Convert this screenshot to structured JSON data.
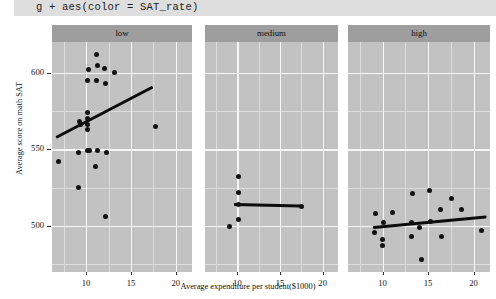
{
  "code_banner": {
    "text": "g + aes(color = SAT_rate)"
  },
  "chart_data": {
    "type": "scatter",
    "title": "g + aes(color = SAT_rate)",
    "xlabel": "Average expenditure per student($1000)",
    "ylabel": "Average score on math SAT",
    "grid": true,
    "legend_position": "none",
    "facet_variable": "SAT_rate",
    "xlim": [
      6.2,
      21.8
    ],
    "ylim": [
      470,
      620
    ],
    "xticks": [
      10,
      15,
      20
    ],
    "yticks": [
      500,
      550,
      600
    ],
    "panel_background": "#c2c2c2",
    "strip_background": "#9e9e9e",
    "point_color": "#121212",
    "line_color": "#0c0c0c",
    "facets": [
      {
        "label": "low",
        "points": [
          {
            "x": 11.2,
            "y": 612
          },
          {
            "x": 11.3,
            "y": 605
          },
          {
            "x": 10.3,
            "y": 602
          },
          {
            "x": 12.1,
            "y": 603
          },
          {
            "x": 13.2,
            "y": 600
          },
          {
            "x": 10.2,
            "y": 595
          },
          {
            "x": 11.2,
            "y": 595
          },
          {
            "x": 12.2,
            "y": 593
          },
          {
            "x": 10.2,
            "y": 574
          },
          {
            "x": 10.2,
            "y": 570
          },
          {
            "x": 9.3,
            "y": 568
          },
          {
            "x": 9.4,
            "y": 566
          },
          {
            "x": 10.2,
            "y": 566
          },
          {
            "x": 10.2,
            "y": 563
          },
          {
            "x": 17.7,
            "y": 565
          },
          {
            "x": 9.1,
            "y": 548
          },
          {
            "x": 10.2,
            "y": 549
          },
          {
            "x": 10.4,
            "y": 549
          },
          {
            "x": 11.3,
            "y": 549
          },
          {
            "x": 12.3,
            "y": 548
          },
          {
            "x": 6.9,
            "y": 542
          },
          {
            "x": 11.1,
            "y": 539
          },
          {
            "x": 9.1,
            "y": 525
          },
          {
            "x": 12.2,
            "y": 506
          }
        ],
        "fit_line": {
          "x1": 6.6,
          "y1": 558,
          "x2": 17.4,
          "y2": 591
        }
      },
      {
        "label": "medium",
        "points": [
          {
            "x": 10.1,
            "y": 532
          },
          {
            "x": 10.1,
            "y": 522
          },
          {
            "x": 10.1,
            "y": 514
          },
          {
            "x": 10.1,
            "y": 504
          },
          {
            "x": 9.1,
            "y": 500
          },
          {
            "x": 17.5,
            "y": 513
          }
        ],
        "fit_line": {
          "x1": 9.6,
          "y1": 514,
          "x2": 17.5,
          "y2": 513
        }
      },
      {
        "label": "high",
        "points": [
          {
            "x": 13.3,
            "y": 521
          },
          {
            "x": 15.2,
            "y": 523
          },
          {
            "x": 17.6,
            "y": 518
          },
          {
            "x": 16.4,
            "y": 511
          },
          {
            "x": 18.7,
            "y": 511
          },
          {
            "x": 9.2,
            "y": 508
          },
          {
            "x": 11.1,
            "y": 509
          },
          {
            "x": 15.3,
            "y": 503
          },
          {
            "x": 13.2,
            "y": 502
          },
          {
            "x": 10.1,
            "y": 502
          },
          {
            "x": 14.1,
            "y": 499
          },
          {
            "x": 9.1,
            "y": 496
          },
          {
            "x": 20.9,
            "y": 497
          },
          {
            "x": 13.2,
            "y": 493
          },
          {
            "x": 16.5,
            "y": 493
          },
          {
            "x": 10.0,
            "y": 491
          },
          {
            "x": 10.0,
            "y": 487
          },
          {
            "x": 14.3,
            "y": 478
          }
        ],
        "fit_line": {
          "x1": 8.9,
          "y1": 499,
          "x2": 21.4,
          "y2": 506
        }
      }
    ]
  },
  "axis": {
    "y_title": "Average score on math SAT",
    "x_title": "Average expenditure per student($1000)",
    "y_ticks": [
      "600",
      "550",
      "500"
    ],
    "x_ticks": [
      "10",
      "15",
      "20"
    ]
  }
}
